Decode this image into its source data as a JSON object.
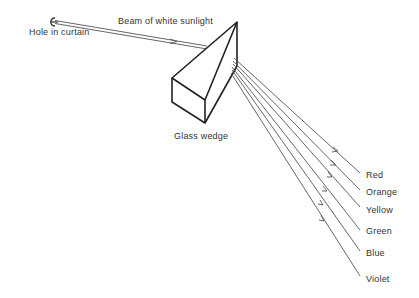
{
  "diagram": {
    "labels": {
      "hole": "Hole in curtain",
      "beam": "Beam of white sunlight",
      "prism": "Glass wedge"
    },
    "spectrum": [
      {
        "name": "Red",
        "color": "#444444"
      },
      {
        "name": "Orange",
        "color": "#444444"
      },
      {
        "name": "Yellow",
        "color": "#444444"
      },
      {
        "name": "Green",
        "color": "#444444"
      },
      {
        "name": "Blue",
        "color": "#444444"
      },
      {
        "name": "Violet",
        "color": "#444444"
      }
    ]
  }
}
